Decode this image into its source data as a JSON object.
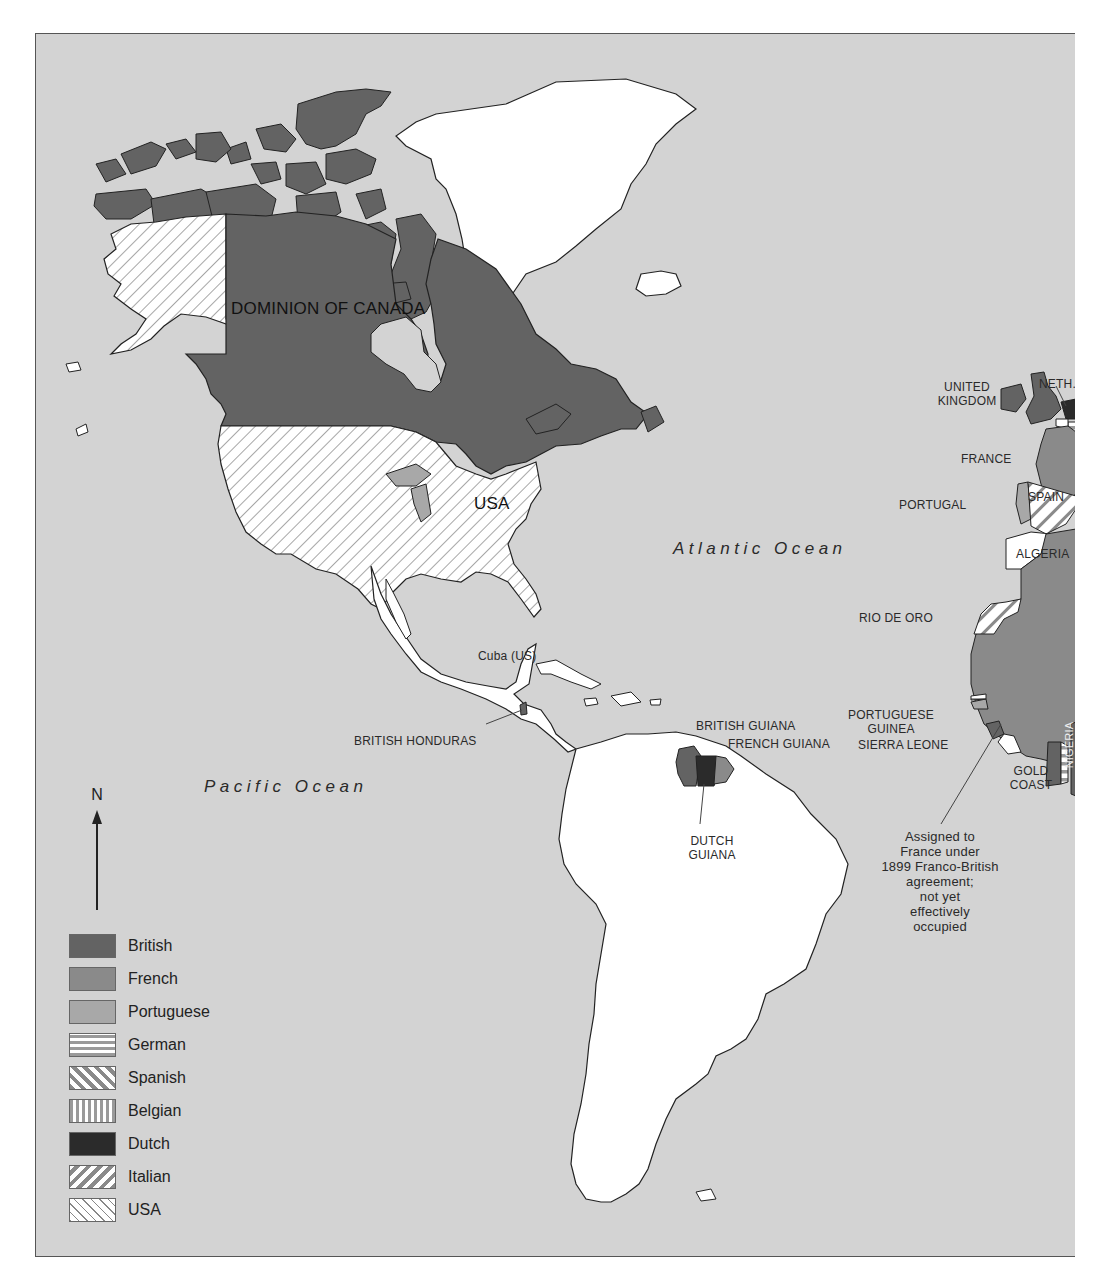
{
  "map": {
    "colors": {
      "sea": "#d3d3d3",
      "british": "#636363",
      "french": "#8a8a8a",
      "portuguese": "#a8a8a8",
      "dutch": "#2b2b2b",
      "unclaimed": "#ffffff",
      "outline": "#222222"
    },
    "regions": {
      "canada": "DOMINION OF CANADA",
      "usa": "USA",
      "cuba": "Cuba (US)",
      "british_honduras": "BRITISH HONDURAS",
      "british_guiana": "BRITISH GUIANA",
      "french_guiana": "FRENCH GUIANA",
      "dutch_guiana_1": "DUTCH",
      "dutch_guiana_2": "GUIANA",
      "united_kingdom_1": "UNITED",
      "united_kingdom_2": "KINGDOM",
      "netherlands": "NETH.",
      "france": "FRANCE",
      "portugal": "PORTUGAL",
      "spain": "SPAIN",
      "algeria": "ALGERIA",
      "rio_de_oro": "RIO DE ORO",
      "portuguese_guinea_1": "PORTUGUESE",
      "portuguese_guinea_2": "GUINEA",
      "sierra_leone": "SIERRA LEONE",
      "gold_coast_1": "GOLD",
      "gold_coast_2": "COAST",
      "nigeria": "NIGERIA"
    },
    "oceans": {
      "atlantic": "Atlantic Ocean",
      "pacific": "Pacific Ocean"
    },
    "annotation": {
      "line1": "Assigned to",
      "line2": "France under",
      "line3": "1899 Franco-British",
      "line4": "agreement;",
      "line5": "not yet",
      "line6": "effectively",
      "line7": "occupied"
    },
    "compass": {
      "label": "N",
      "icon": "north-arrow-icon"
    },
    "legend": [
      {
        "label": "British",
        "pattern": "solid-dark"
      },
      {
        "label": "French",
        "pattern": "solid-mid"
      },
      {
        "label": "Portuguese",
        "pattern": "solid-light"
      },
      {
        "label": "German",
        "pattern": "horizontal-stripes"
      },
      {
        "label": "Spanish",
        "pattern": "diagonal-down-thick"
      },
      {
        "label": "Belgian",
        "pattern": "vertical-stripes"
      },
      {
        "label": "Dutch",
        "pattern": "solid-black"
      },
      {
        "label": "Italian",
        "pattern": "diagonal-up-thick"
      },
      {
        "label": "USA",
        "pattern": "diagonal-down-thin"
      }
    ]
  }
}
